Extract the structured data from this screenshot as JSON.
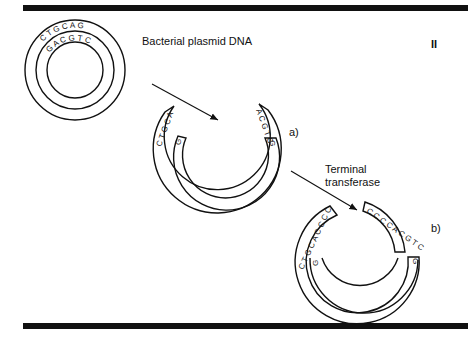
{
  "figure": {
    "panel_marker": "II",
    "title_label": "Bacterial plasmid DNA",
    "step_a_label": "a)",
    "step_b_label": "b)",
    "enzyme_label_line1": "Terminal",
    "enzyme_label_line2": "transferase"
  },
  "plasmid_intact": {
    "outer_strand_seq": "CTGCAG",
    "inner_strand_seq": "GACGTC"
  },
  "plasmid_cut": {
    "left_outer_seq": "CTGCA",
    "left_inner_seq": "G",
    "right_outer_seq": "ACGTC",
    "right_inner_seq": "G"
  },
  "plasmid_tailed": {
    "left_outer_seq": "CTGCACCCC",
    "left_inner_seq": "G",
    "right_outer_seq": "CCCCACGTC",
    "right_inner_seq": "G"
  },
  "colors": {
    "ink": "#111111",
    "background": "#ffffff"
  }
}
